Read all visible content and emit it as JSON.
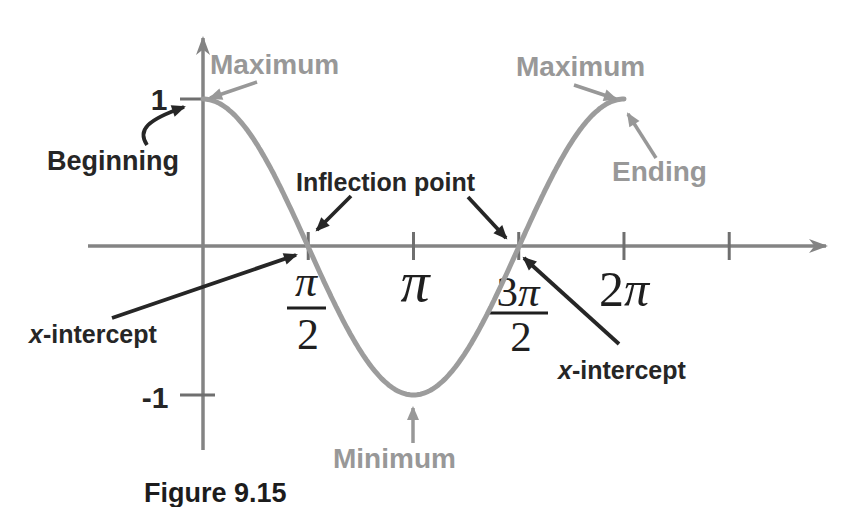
{
  "figure": {
    "caption": "Figure 9.15"
  },
  "labels": {
    "maximum": "Maximum",
    "minimum": "Minimum",
    "beginning": "Beginning",
    "ending": "Ending",
    "inflection_point": "Inflection point",
    "x_intercept": {
      "x": "x",
      "rest": "-intercept"
    },
    "y_max_tick": "1",
    "y_min_tick": "-1"
  },
  "x_axis_labels": {
    "pi_over_2": {
      "numerator": "π",
      "denominator": "2"
    },
    "pi": "π",
    "three_pi_over_2": {
      "coefficient": "3",
      "symbol": "π",
      "denominator": "2"
    },
    "two_pi": {
      "coefficient": "2",
      "symbol": "π"
    }
  },
  "chart_data": {
    "type": "line",
    "function": "y = cos(x), one full period",
    "x_unit": "radians",
    "xlim_radians": [
      0,
      6.2832
    ],
    "ylim": [
      -1,
      1
    ],
    "x_ticks_radians": [
      1.5708,
      3.1416,
      4.7124,
      6.2832,
      7.854
    ],
    "x_tick_labels": [
      "π/2",
      "π",
      "3π/2",
      "2π",
      ""
    ],
    "y_ticks": [
      1,
      -1
    ],
    "y_tick_labels": [
      "1",
      "-1"
    ],
    "key_points": [
      {
        "x_label": "0",
        "x_radians": 0,
        "y": 1,
        "annotations": [
          "Beginning",
          "Maximum"
        ]
      },
      {
        "x_label": "π/2",
        "x_radians": 1.5708,
        "y": 0,
        "annotations": [
          "x-intercept",
          "Inflection point"
        ]
      },
      {
        "x_label": "π",
        "x_radians": 3.1416,
        "y": -1,
        "annotations": [
          "Minimum"
        ]
      },
      {
        "x_label": "3π/2",
        "x_radians": 4.7124,
        "y": 0,
        "annotations": [
          "x-intercept",
          "Inflection point"
        ]
      },
      {
        "x_label": "2π",
        "x_radians": 6.2832,
        "y": 1,
        "annotations": [
          "Maximum",
          "Ending"
        ]
      }
    ],
    "grid": false,
    "legend": false
  },
  "colors": {
    "curve": "#9c9c9c",
    "axis": "#848484",
    "tick": "#6f6f6f",
    "gray_label": "#989898",
    "black_label": "#262626"
  }
}
